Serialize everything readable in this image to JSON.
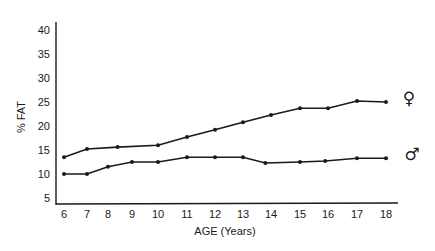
{
  "chart_data": {
    "type": "line",
    "title": "",
    "xlabel": "AGE (Years)",
    "ylabel": "% FAT",
    "ylim": [
      5,
      40
    ],
    "yticks": [
      5,
      10,
      15,
      20,
      25,
      30,
      35,
      40
    ],
    "xticks": [
      6,
      7,
      8,
      9,
      10,
      11,
      12,
      13,
      14,
      15,
      16,
      17,
      18
    ],
    "grid": false,
    "legend_position": "right (symbols at line ends)",
    "series": [
      {
        "name": "Female",
        "symbol": "♀",
        "x": [
          6,
          7,
          8.4,
          10,
          11,
          12,
          13,
          14,
          15,
          16,
          17,
          18
        ],
        "values": [
          13.5,
          15.2,
          15.6,
          16.0,
          17.7,
          19.2,
          20.8,
          22.3,
          23.7,
          23.7,
          25.2,
          25.0
        ]
      },
      {
        "name": "Male",
        "symbol": "♂",
        "x": [
          6,
          7,
          8,
          9,
          10,
          11,
          12,
          13,
          13.8,
          15,
          15.9,
          17,
          18
        ],
        "values": [
          10.0,
          10.0,
          11.5,
          12.5,
          12.5,
          13.5,
          13.5,
          13.5,
          12.3,
          12.5,
          12.7,
          13.3,
          13.3
        ]
      }
    ]
  },
  "labels": {
    "ylabel": "% FAT",
    "xlabel": "AGE (Years)",
    "female_symbol": "♀",
    "male_symbol": "♂"
  }
}
